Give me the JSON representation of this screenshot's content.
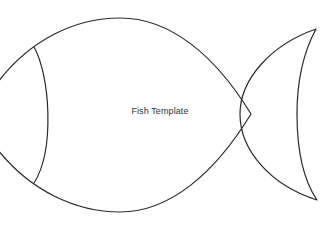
{
  "diagram": {
    "title": "Fish Template",
    "stroke_color": "#2a2a2a",
    "background": "#ffffff",
    "parts": [
      "body",
      "gill-line",
      "tail-fin"
    ]
  }
}
